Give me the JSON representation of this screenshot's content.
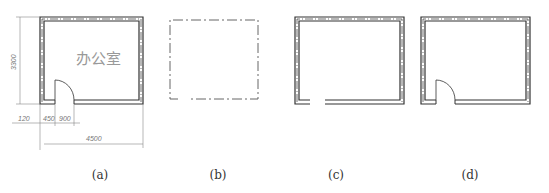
{
  "panels": [
    {
      "id": "a",
      "caption": "(a)",
      "room_label": "办公室",
      "dimensions": {
        "height": "3300",
        "left_offset": "120",
        "door_pier": "450",
        "door_width": "900",
        "width": "4500"
      }
    },
    {
      "id": "b",
      "caption": "(b)"
    },
    {
      "id": "c",
      "caption": "(c)"
    },
    {
      "id": "d",
      "caption": "(d)"
    }
  ],
  "colors": {
    "line": "#333333",
    "dim_line": "#888888",
    "text": "#333333"
  }
}
